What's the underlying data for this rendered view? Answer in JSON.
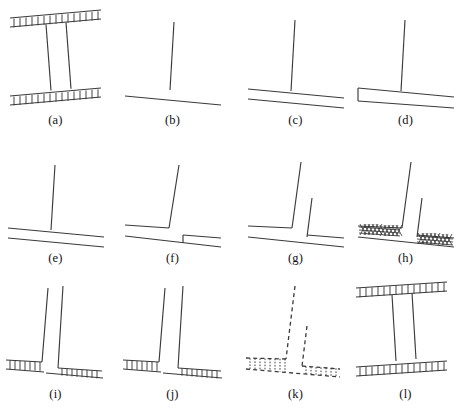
{
  "figure": {
    "background_color": "#ffffff",
    "line_color": "#3a3a3a",
    "panel_count": 12,
    "rows": 3,
    "columns": 4
  },
  "panels": [
    {
      "id": "a",
      "label": "(a)",
      "description": "I-beam cross-section with hatched top and bottom flanges",
      "style": "solid",
      "hatch": "ticks"
    },
    {
      "id": "b",
      "label": "(b)",
      "description": "Single vertical web line above a single sloped base line",
      "style": "solid",
      "hatch": "none"
    },
    {
      "id": "c",
      "label": "(c)",
      "description": "Vertical web line on a two-line open-ended plate",
      "style": "solid",
      "hatch": "none"
    },
    {
      "id": "d",
      "label": "(d)",
      "description": "Vertical web line on a closed-ended wedge plate",
      "style": "solid",
      "hatch": "none"
    },
    {
      "id": "e",
      "label": "(e)",
      "description": "Vertical web line meeting a two-line plate",
      "style": "solid",
      "hatch": "none"
    },
    {
      "id": "f",
      "label": "(f)",
      "description": "Bent web line on a plate with a stepped lower edge",
      "style": "solid",
      "hatch": "none"
    },
    {
      "id": "g",
      "label": "(g)",
      "description": "Tall and short web lines on a two-line plate",
      "style": "solid",
      "hatch": "none"
    },
    {
      "id": "h",
      "label": "(h)",
      "description": "Same as g with dense cross-hatched plate fill",
      "style": "solid",
      "hatch": "cross"
    },
    {
      "id": "i",
      "label": "(i)",
      "description": "Two-line web on a hatched base flange",
      "style": "solid",
      "hatch": "ticks"
    },
    {
      "id": "j",
      "label": "(j)",
      "description": "Two-line web on a hatched base flange, wider web",
      "style": "solid",
      "hatch": "ticks"
    },
    {
      "id": "k",
      "label": "(k)",
      "description": "Dashed outline version with dashed hatch ticks",
      "style": "dashed",
      "hatch": "ticks"
    },
    {
      "id": "l",
      "label": "(l)",
      "description": "I-beam cross-section with hatched flanges",
      "style": "solid",
      "hatch": "ticks"
    }
  ]
}
